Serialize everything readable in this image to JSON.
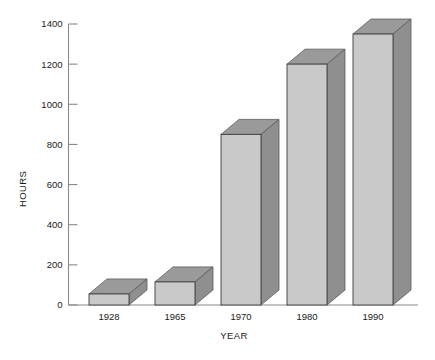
{
  "chart_data": {
    "type": "bar",
    "title": "",
    "subtitle": "",
    "xlabel": "YEAR",
    "ylabel": "HOURS",
    "categories": [
      "1928",
      "1965",
      "1970",
      "1980",
      "1990"
    ],
    "values": [
      55,
      115,
      850,
      1200,
      1350
    ],
    "series": [
      {
        "name": "Hours",
        "values": [
          55,
          115,
          850,
          1200,
          1350
        ]
      }
    ],
    "ylim": [
      0,
      1400
    ],
    "ytick_values": [
      0,
      200,
      400,
      600,
      800,
      1000,
      1200,
      1400
    ],
    "ytick_labels": [
      "0",
      "200",
      "400",
      "600",
      "800",
      "1000",
      "1200",
      "1400"
    ],
    "grid": false,
    "legend": false,
    "legend_position": "none",
    "style": "3d-shaded-bars",
    "colors": {
      "bar_front": "#c9c9c9",
      "bar_top": "#9a9a9a",
      "bar_side": "#8f8f8f",
      "bar_outline": "#3c3c3c",
      "axis": "#8a8a8a",
      "text": "#1a1a1a",
      "background": "#ffffff"
    }
  }
}
